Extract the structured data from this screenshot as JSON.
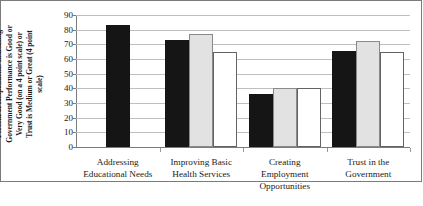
{
  "chart_data": {
    "type": "bar",
    "title": "",
    "xlabel": "",
    "ylabel": "Percent of Respondents Indicating Government Performance is Good or Very Good (on a 4 point scale) or Trust is Medium or Great (4 point scale)",
    "ylim": [
      0,
      90
    ],
    "ytick_labels": [
      "90",
      "80",
      "70",
      "60",
      "50",
      "40",
      "30",
      "20",
      "10",
      "0"
    ],
    "ytick_values": [
      90,
      80,
      70,
      60,
      50,
      40,
      30,
      20,
      10,
      0
    ],
    "grid": true,
    "legend": "none",
    "categories": [
      "Addressing\nEducational Needs",
      "Improving Basic\nHealth Services",
      "Creating\nEmployment\nOpportunities",
      "Trust in the\nGovernment"
    ],
    "series": [
      {
        "name": "series-1",
        "color": "#151515",
        "style": "black-filled",
        "values": [
          83,
          73,
          36,
          65.5
        ]
      },
      {
        "name": "series-2",
        "color": "#e2e2e2",
        "style": "light-gray-filled",
        "values": [
          null,
          77,
          40,
          72
        ]
      },
      {
        "name": "series-3",
        "color": "#ffffff",
        "style": "white-outlined",
        "values": [
          null,
          65,
          40.5,
          65
        ]
      }
    ]
  },
  "axis": {
    "y_title_lines": "Percent of Respondents Indicating\nGovernment Performance is Good or\nVery Good (on a 4 point scale) or\nTrust is Medium or Great (4 point\nscale)"
  },
  "colors": {
    "bar_black": "#151515",
    "bar_gray": "#e2e2e2",
    "bar_white": "#ffffff",
    "gridline": "#bfbfbf",
    "axis": "#7b7b7b",
    "text": "#1a1a1a",
    "background": "#ffffff"
  }
}
